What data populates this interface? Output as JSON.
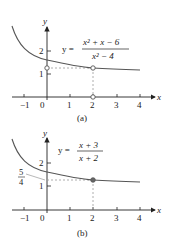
{
  "figure": {
    "panels": [
      {
        "caption": "(a)",
        "equation": {
          "lhs": "y =",
          "numerator": "x² + x − 6",
          "denominator": "x² − 4"
        },
        "axes": {
          "x_label": "x",
          "y_label": "y",
          "x_ticks": [
            "−1",
            "0",
            "1",
            "2",
            "3",
            "4"
          ],
          "y_ticks": [
            "1",
            "2"
          ]
        },
        "hole_points": [
          {
            "x": 2,
            "y": 1.25
          },
          {
            "x": 0,
            "y": 1.25
          },
          {
            "x": 2,
            "y": 0
          }
        ]
      },
      {
        "caption": "(b)",
        "equation": {
          "lhs": "y =",
          "numerator": "x + 3",
          "denominator": "x + 2"
        },
        "axes": {
          "x_label": "x",
          "y_label": "y",
          "x_ticks": [
            "−1",
            "0",
            "1",
            "2",
            "3",
            "4"
          ],
          "y_ticks": [
            "1",
            "2"
          ]
        },
        "y_annotation": {
          "numerator": "5",
          "denominator": "4"
        },
        "filled_point": {
          "x": 2,
          "y": 1.25
        }
      }
    ],
    "colors": {
      "curve": "#555555",
      "axis": "#222222",
      "dashed": "#999999"
    }
  }
}
